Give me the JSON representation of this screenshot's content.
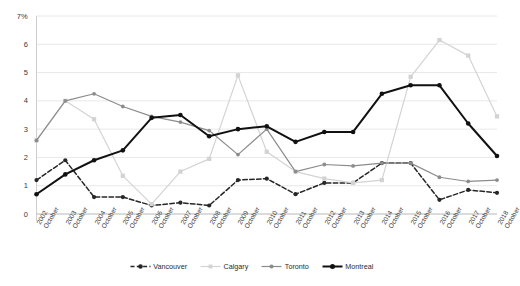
{
  "chart_data": {
    "type": "line",
    "title": "",
    "subtitle": "",
    "xlabel": "",
    "ylabel": "",
    "ylim": [
      0,
      7
    ],
    "yticks": [
      0,
      1,
      2,
      3,
      4,
      5,
      6,
      7
    ],
    "ytick_labels": [
      "0",
      "1",
      "2",
      "3",
      "4",
      "5",
      "6",
      "7%"
    ],
    "grid": true,
    "legend_position": "bottom",
    "categories": [
      "2002 October",
      "2003 October",
      "2004 October",
      "2005 October",
      "2006 October",
      "2007 October",
      "2008 October",
      "2009 October",
      "2010 October",
      "2011 October",
      "2012 October",
      "2013 October",
      "2014 October",
      "2015 October",
      "2016 October",
      "2017 October",
      "2018 October"
    ],
    "category_years": [
      "2002",
      "2003",
      "2004",
      "2005",
      "2006",
      "2007",
      "2008",
      "2009",
      "2010",
      "2011",
      "2012",
      "2013",
      "2014",
      "2015",
      "2016",
      "2017",
      "2018"
    ],
    "category_month": "October",
    "series": [
      {
        "name": "Vancouver",
        "color": "#262626",
        "style": "dashed",
        "marker": "circle",
        "values": [
          1.2,
          1.9,
          0.6,
          0.6,
          0.3,
          0.4,
          0.3,
          1.2,
          1.25,
          0.7,
          1.1,
          1.1,
          1.8,
          1.8,
          0.5,
          0.85,
          0.75
        ]
      },
      {
        "name": "Calgary",
        "color": "#d3d3d3",
        "style": "solid",
        "marker": "square",
        "values": [
          2.6,
          4.0,
          3.35,
          1.35,
          0.35,
          1.5,
          1.95,
          4.9,
          2.2,
          1.5,
          1.25,
          1.1,
          1.2,
          4.85,
          6.15,
          5.6,
          3.45
        ]
      },
      {
        "name": "Toronto",
        "color": "#8c8c8c",
        "style": "solid",
        "marker": "circle",
        "values": [
          2.6,
          4.0,
          4.25,
          3.8,
          3.45,
          3.25,
          2.95,
          2.1,
          3.0,
          1.5,
          1.75,
          1.7,
          1.8,
          1.8,
          1.3,
          1.15,
          1.2
        ]
      },
      {
        "name": "Montreal",
        "color": "#111111",
        "style": "solid-bold",
        "marker": "circle",
        "values": [
          0.7,
          1.4,
          1.9,
          2.25,
          3.4,
          3.5,
          2.75,
          3.0,
          3.1,
          2.55,
          2.9,
          2.9,
          4.25,
          4.55,
          4.55,
          3.2,
          2.05
        ]
      }
    ]
  },
  "legend": {
    "items": [
      {
        "label": "Vancouver"
      },
      {
        "label": "Calgary"
      },
      {
        "label": "Toronto"
      },
      {
        "label": "Montreal"
      }
    ]
  },
  "axis": {
    "top_unit_label": "7%"
  }
}
